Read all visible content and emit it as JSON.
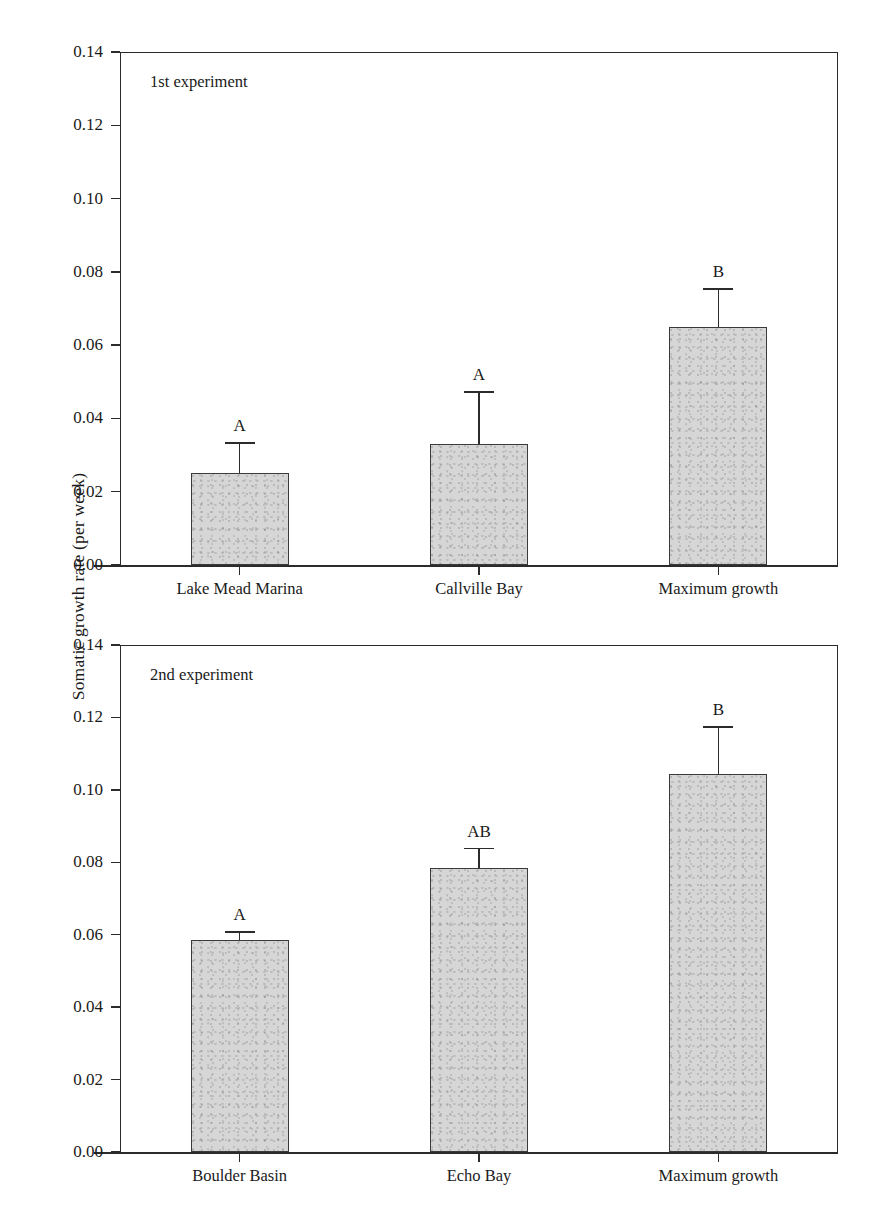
{
  "figure": {
    "ylabel": "Somatic growth rate (per week)",
    "background": "#ffffff",
    "bar_fill": "#d6d6d6",
    "bar_edge": "#3a3a3a",
    "axis_color": "#2b2b2b"
  },
  "chart_data": [
    {
      "type": "bar",
      "title": "1st experiment",
      "panel": "top",
      "categories": [
        "Lake Mead Marina",
        "Callville Bay",
        "Maximum growth"
      ],
      "values": [
        0.025,
        0.033,
        0.065
      ],
      "errors": [
        0.0085,
        0.0145,
        0.0105
      ],
      "significance_letters": [
        "A",
        "A",
        "B"
      ],
      "xlabel": "",
      "ylabel": "Somatic growth rate (per week)",
      "ylim": [
        0.0,
        0.14
      ],
      "ytick_labels": [
        "0.00",
        "0.02",
        "0.04",
        "0.06",
        "0.08",
        "0.10",
        "0.12",
        "0.14"
      ],
      "ytick_values": [
        0.0,
        0.02,
        0.04,
        0.06,
        0.08,
        0.1,
        0.12,
        0.14
      ],
      "grid": false,
      "legend": "none"
    },
    {
      "type": "bar",
      "title": "2nd experiment",
      "panel": "bottom",
      "categories": [
        "Boulder Basin",
        "Echo Bay",
        "Maximum growth"
      ],
      "values": [
        0.0585,
        0.0785,
        0.1045
      ],
      "errors": [
        0.0025,
        0.0055,
        0.013
      ],
      "significance_letters": [
        "A",
        "AB",
        "B"
      ],
      "xlabel": "",
      "ylabel": "Somatic growth rate (per week)",
      "ylim": [
        0.0,
        0.14
      ],
      "ytick_labels": [
        "0.00",
        "0.02",
        "0.04",
        "0.06",
        "0.08",
        "0.10",
        "0.12",
        "0.14"
      ],
      "ytick_values": [
        0.0,
        0.02,
        0.04,
        0.06,
        0.08,
        0.1,
        0.12,
        0.14
      ],
      "grid": false,
      "legend": "none"
    }
  ]
}
